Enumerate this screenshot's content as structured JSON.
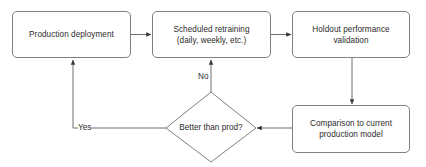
{
  "diagram": {
    "background_color": "#ffffff",
    "line_color": "#808080",
    "text_color": "#2b2b2b",
    "nodes": [
      {
        "id": "production-deployment",
        "shape": "rounded-rectangle",
        "text": "Production deployment",
        "lines": [
          "Production deployment"
        ]
      },
      {
        "id": "scheduled-retraining",
        "shape": "rounded-rectangle",
        "text": "Scheduled retraining (daily, weekly, etc.)",
        "lines": [
          "Scheduled retraining",
          "(daily, weekly, etc.)"
        ]
      },
      {
        "id": "holdout-performance-validation",
        "shape": "rounded-rectangle",
        "text": "Holdout performance validation",
        "lines": [
          "Holdout performance",
          "validation"
        ]
      },
      {
        "id": "comparison-to-current-production-model",
        "shape": "rounded-rectangle",
        "text": "Comparison to current production model",
        "lines": [
          "Comparison to current",
          "production model"
        ]
      },
      {
        "id": "better-than-prod",
        "shape": "diamond",
        "text": "Better than prod?",
        "lines": [
          "Better than prod?"
        ]
      }
    ],
    "edges": [
      {
        "id": "deployment-to-retraining",
        "from": "production-deployment",
        "to": "scheduled-retraining",
        "label": ""
      },
      {
        "id": "retraining-to-validation",
        "from": "scheduled-retraining",
        "to": "holdout-performance-validation",
        "label": ""
      },
      {
        "id": "validation-to-comparison",
        "from": "holdout-performance-validation",
        "to": "comparison-to-current-production-model",
        "label": ""
      },
      {
        "id": "comparison-to-decision",
        "from": "comparison-to-current-production-model",
        "to": "better-than-prod",
        "label": ""
      },
      {
        "id": "decision-no-to-retraining",
        "from": "better-than-prod",
        "to": "scheduled-retraining",
        "label": "No"
      },
      {
        "id": "decision-yes-to-deployment",
        "from": "better-than-prod",
        "to": "production-deployment",
        "label": "Yes"
      }
    ]
  }
}
